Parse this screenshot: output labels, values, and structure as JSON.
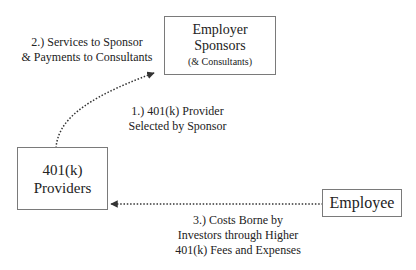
{
  "nodes": {
    "sponsors": {
      "line1": "Employer",
      "line2": "Sponsors",
      "line3": "(& Consultants)"
    },
    "providers": {
      "line1": "401(k)",
      "line2": "Providers"
    },
    "employee": {
      "line1": "Employee"
    }
  },
  "edges": [
    {
      "from": "providers",
      "to": "sponsors",
      "style": "dotted",
      "label_top": {
        "line1": "2.) Services to Sponsor",
        "line2": "& Payments to Consultants"
      },
      "label_bottom": {
        "line1": "1.) 401(k) Provider",
        "line2": "Selected by Sponsor"
      }
    },
    {
      "from": "employee",
      "to": "providers",
      "style": "dotted",
      "label": {
        "line1": "3.) Costs Borne by",
        "line2": "Investors through Higher",
        "line3": "401(k) Fees and Expenses"
      }
    }
  ],
  "colors": {
    "box_border": "#7a7a7a",
    "arrow": "#333333",
    "text": "#222222"
  }
}
